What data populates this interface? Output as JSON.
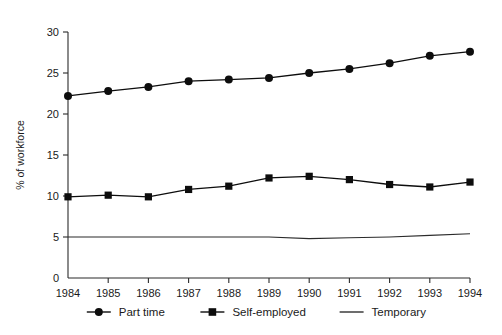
{
  "chart_data": {
    "type": "line",
    "title": "",
    "xlabel": "",
    "ylabel": "% of workforce",
    "x": [
      1984,
      1985,
      1986,
      1987,
      1988,
      1989,
      1990,
      1991,
      1992,
      1993,
      1994
    ],
    "xtick_labels": [
      "1984",
      "1985",
      "1986",
      "1987",
      "1988",
      "1989",
      "1990",
      "1991",
      "1992",
      "1993",
      "1994"
    ],
    "ytick_labels": [
      "0",
      "5",
      "10",
      "15",
      "20",
      "25",
      "30"
    ],
    "yticks": [
      0,
      5,
      10,
      15,
      20,
      25,
      30
    ],
    "ylim": [
      0,
      30
    ],
    "xlim": [
      1984,
      1994
    ],
    "grid": false,
    "legend_position": "bottom",
    "series": [
      {
        "name": "Part time",
        "marker": "circle",
        "values": [
          22.2,
          22.8,
          23.3,
          24.0,
          24.2,
          24.4,
          25.0,
          25.5,
          26.2,
          27.1,
          27.6
        ]
      },
      {
        "name": "Self-employed",
        "marker": "square",
        "values": [
          9.9,
          10.1,
          9.9,
          10.8,
          11.2,
          12.2,
          12.4,
          12.0,
          11.4,
          11.1,
          11.7
        ]
      },
      {
        "name": "Temporary",
        "marker": "none",
        "values": [
          5.0,
          5.0,
          5.0,
          5.0,
          5.0,
          5.0,
          4.8,
          4.9,
          5.0,
          5.2,
          5.4
        ]
      }
    ]
  },
  "legend": {
    "items": [
      {
        "label": "Part time",
        "marker": "circle"
      },
      {
        "label": "Self-employed",
        "marker": "square"
      },
      {
        "label": "Temporary",
        "marker": "none"
      }
    ]
  },
  "colors": {
    "series_stroke": "#0d0d0d",
    "axis": "#2b2b2b",
    "panel_background": "#ffffff",
    "page_background": "#c8c8c8"
  }
}
